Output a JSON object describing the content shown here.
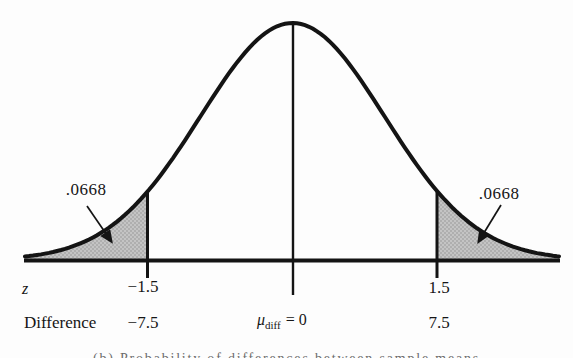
{
  "colors": {
    "curve": "#141414",
    "shade_base": "#c4c4c4",
    "shade_dot": "#8a8a8a",
    "background": "#fdfdfd"
  },
  "labels": {
    "left_tail_probability": ".0668",
    "right_tail_probability": ".0668",
    "z_row_label": "z",
    "z_left": "−1.5",
    "z_right": "1.5",
    "difference_row_label": "Difference",
    "difference_left": "−7.5",
    "mu_symbol": "μ",
    "mu_subscript": "diff",
    "mu_equals": "= 0",
    "difference_right": "7.5",
    "caption": "(b) Probability of differences between sample means"
  },
  "chart_data": {
    "type": "area",
    "curve": "standard normal distribution bell curve",
    "title": "",
    "x_axes": [
      {
        "label": "z",
        "ticks": [
          -1.5,
          1.5
        ]
      },
      {
        "label": "Difference",
        "ticks": [
          -7.5,
          0,
          7.5
        ],
        "center_tick_label": "μ_diff = 0"
      }
    ],
    "critical_values_z": [
      -1.5,
      1.5
    ],
    "shaded_regions": [
      {
        "region": "z ≤ −1.5",
        "area": 0.0668,
        "difference_value": -7.5
      },
      {
        "region": "z ≥ 1.5",
        "area": 0.0668,
        "difference_value": 7.5
      }
    ],
    "annotations": [
      ".0668 arrow into left tail",
      ".0668 arrow into right tail"
    ],
    "legend": "none",
    "grid": false
  }
}
